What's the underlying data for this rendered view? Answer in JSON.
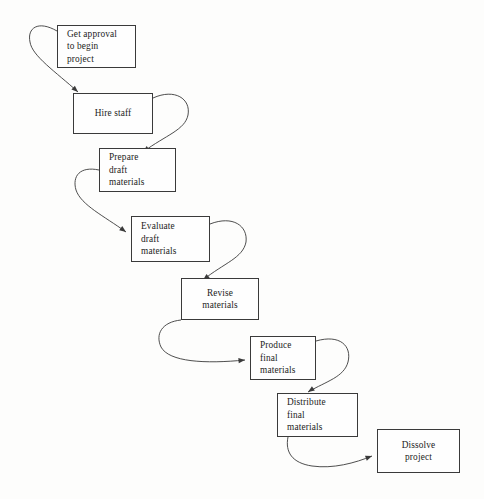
{
  "diagram": {
    "background_color": "#fdfdfc",
    "line_color": "#3a3a3a",
    "text_color": "#1c1c1c",
    "nodes": [
      {
        "id": "get-approval",
        "label": "Get approval\nto begin\nproject",
        "x": 57,
        "y": 25,
        "width": 79,
        "height": 43,
        "align": "left"
      },
      {
        "id": "hire-staff",
        "label": "Hire staff",
        "x": 73,
        "y": 93,
        "width": 80,
        "height": 41,
        "align": "center"
      },
      {
        "id": "prepare-draft-materials",
        "label": "Prepare\ndraft\nmaterials",
        "x": 99,
        "y": 148,
        "width": 77,
        "height": 44,
        "align": "left"
      },
      {
        "id": "evaluate-draft-materials",
        "label": "Evaluate\ndraft\nmaterials",
        "x": 131,
        "y": 216,
        "width": 79,
        "height": 46,
        "align": "left"
      },
      {
        "id": "revise-materials",
        "label": "Revise\nmaterials",
        "x": 181,
        "y": 278,
        "width": 78,
        "height": 42,
        "align": "center"
      },
      {
        "id": "produce-final-materials",
        "label": "Produce\nfinal\nmaterials",
        "x": 250,
        "y": 336,
        "width": 66,
        "height": 44,
        "align": "left"
      },
      {
        "id": "distribute-final-materials",
        "label": "Distribute\nfinal\nmaterials",
        "x": 277,
        "y": 393,
        "width": 81,
        "height": 44,
        "align": "left"
      },
      {
        "id": "dissolve-project",
        "label": "Dissolve\nproject",
        "x": 377,
        "y": 429,
        "width": 83,
        "height": 44,
        "align": "center"
      }
    ],
    "edges": [
      {
        "id": "edge-approval-to-hire",
        "from": "get-approval",
        "to": "hire-staff",
        "path": "M 57 31 C 38 20 27 28 30 42 C 32 56 56 72 78 92",
        "arrow_at": [
          78,
          92
        ],
        "arrow_angle": 42
      },
      {
        "id": "edge-hire-to-prepare",
        "from": "hire-staff",
        "to": "prepare-draft-materials",
        "path": "M 153 98 C 175 88 191 99 188 115 C 185 130 166 135 143 152",
        "arrow_at": [
          143,
          152
        ],
        "arrow_angle": 143
      },
      {
        "id": "edge-prepare-to-evaluate",
        "from": "prepare-draft-materials",
        "to": "evaluate-draft-materials",
        "path": "M 99 170 C 80 166 72 176 76 190 C 81 205 104 216 126 232",
        "arrow_at": [
          126,
          232
        ],
        "arrow_angle": 36
      },
      {
        "id": "edge-evaluate-to-revise",
        "from": "evaluate-draft-materials",
        "to": "revise-materials",
        "path": "M 210 224 C 233 215 248 226 246 242 C 243 258 224 263 203 280",
        "arrow_at": [
          203,
          280
        ],
        "arrow_angle": 142
      },
      {
        "id": "edge-revise-to-produce",
        "from": "revise-materials",
        "to": "produce-final-materials",
        "path": "M 181 320 C 162 322 155 334 161 347 C 169 362 205 364 245 360",
        "arrow_at": [
          245,
          360
        ],
        "arrow_angle": 355
      },
      {
        "id": "edge-produce-to-distribute",
        "from": "produce-final-materials",
        "to": "distribute-final-materials",
        "path": "M 316 341 C 340 334 352 346 348 362 C 344 377 327 381 308 392",
        "arrow_at": [
          308,
          392
        ],
        "arrow_angle": 146
      },
      {
        "id": "edge-distribute-to-dissolve",
        "from": "distribute-final-materials",
        "to": "dissolve-project",
        "path": "M 288 437 C 285 452 292 463 312 466 C 333 469 355 463 372 456",
        "arrow_at": [
          372,
          456
        ],
        "arrow_angle": 340
      }
    ]
  }
}
